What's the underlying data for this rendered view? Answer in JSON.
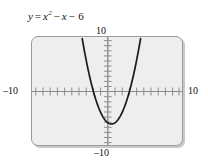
{
  "figure": {
    "equation_text": "y = x² − x − 6",
    "equation_lhs": "y",
    "equation_eq": "=",
    "equation_x": "x",
    "equation_exp": "2",
    "equation_minus1": "−",
    "equation_x2": "x",
    "equation_minus2": "−",
    "equation_const": "6"
  },
  "labels": {
    "top": "10",
    "bottom": "–10",
    "left": "–10",
    "right": "10"
  },
  "colors": {
    "plot_background": "#eeeeee",
    "frame": "#9a9a9a",
    "axis": "#8d8d8d",
    "curve": "#1a1a1a",
    "text": "#111111",
    "page_background": "#ffffff"
  },
  "chart_data": {
    "type": "line",
    "function": "y = x^2 - x - 6",
    "xlabel": "x",
    "ylabel": "y",
    "xlim": [
      -10,
      10
    ],
    "ylim": [
      -10,
      10
    ],
    "xticks": [
      -10,
      -9,
      -8,
      -7,
      -6,
      -5,
      -4,
      -3,
      -2,
      -1,
      0,
      1,
      2,
      3,
      4,
      5,
      6,
      7,
      8,
      9,
      10
    ],
    "yticks": [
      -10,
      -9,
      -8,
      -7,
      -6,
      -5,
      -4,
      -3,
      -2,
      -1,
      0,
      1,
      2,
      3,
      4,
      5,
      6,
      7,
      8,
      9,
      10
    ],
    "tick_labels_shown": [
      "-10",
      "10",
      "-10",
      "10"
    ],
    "grid": false,
    "legend": false,
    "vertex": [
      0.5,
      -6.25
    ],
    "roots": [
      -2,
      3
    ],
    "y_intercept": -6,
    "x": [
      -4.0,
      -3.75,
      -3.5,
      -3.25,
      -3.0,
      -2.75,
      -2.5,
      -2.25,
      -2.0,
      -1.75,
      -1.5,
      -1.25,
      -1.0,
      -0.75,
      -0.5,
      -0.25,
      0.0,
      0.25,
      0.5,
      0.75,
      1.0,
      1.25,
      1.5,
      1.75,
      2.0,
      2.25,
      2.5,
      2.75,
      3.0,
      3.25,
      3.5,
      3.75,
      4.0,
      4.25,
      4.5,
      4.75,
      5.0
    ],
    "y": [
      14.0,
      11.8125,
      9.75,
      7.8125,
      6.0,
      4.3125,
      2.75,
      1.3125,
      0.0,
      -1.1875,
      -2.25,
      -3.1875,
      -4.0,
      -4.6875,
      -5.25,
      -5.6875,
      -6.0,
      -6.1875,
      -6.25,
      -6.1875,
      -6.0,
      -5.6875,
      -5.25,
      -4.6875,
      -4.0,
      -3.1875,
      -2.25,
      -1.1875,
      0.0,
      1.3125,
      2.75,
      4.3125,
      6.0,
      7.8125,
      9.75,
      11.8125,
      14.0
    ],
    "visible_x_range": [
      -3.55,
      4.55
    ]
  }
}
